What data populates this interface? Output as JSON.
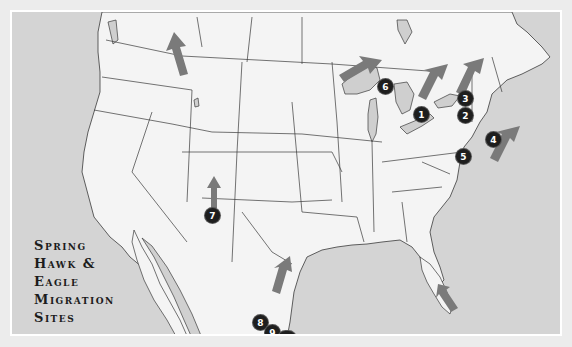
{
  "title": {
    "lines": [
      "Spring",
      "Hawk &",
      "Eagle",
      "Migration",
      "Sites"
    ]
  },
  "colors": {
    "water": "#d4d4d4",
    "land": "#f4f4f4",
    "lakes": "#cfcfcf",
    "borders": "#3a3a3a",
    "arrows": "#7a7a7a",
    "markers": "#1e1e1e",
    "frame": "#ececec"
  },
  "sites": [
    {
      "id": 1,
      "label": "1",
      "region": "Lake Erie / Ontario shore"
    },
    {
      "id": 2,
      "label": "2",
      "region": "Central New York"
    },
    {
      "id": 3,
      "label": "3",
      "region": "Northern New York"
    },
    {
      "id": 4,
      "label": "4",
      "region": "Atlantic coast (New Jersey)"
    },
    {
      "id": 5,
      "label": "5",
      "region": "Mid-Atlantic"
    },
    {
      "id": 6,
      "label": "6",
      "region": "Upper Michigan / Lake Superior"
    },
    {
      "id": 7,
      "label": "7",
      "region": "New Mexico"
    },
    {
      "id": 8,
      "label": "8",
      "region": "South Texas"
    },
    {
      "id": 9,
      "label": "9",
      "region": "South Texas"
    },
    {
      "id": 10,
      "label": "10",
      "region": "Texas Gulf Coast"
    }
  ],
  "arrows": [
    {
      "name": "montana-arrow",
      "direction": "north-west"
    },
    {
      "name": "lake-superior-arrow",
      "direction": "north-east"
    },
    {
      "name": "ontario-arrow",
      "direction": "north-east"
    },
    {
      "name": "new-york-arrow",
      "direction": "north-east"
    },
    {
      "name": "atlantic-arrow",
      "direction": "north-east"
    },
    {
      "name": "new-mexico-arrow",
      "direction": "north"
    },
    {
      "name": "texas-arrow",
      "direction": "north-east"
    },
    {
      "name": "florida-arrow",
      "direction": "north-west"
    }
  ]
}
